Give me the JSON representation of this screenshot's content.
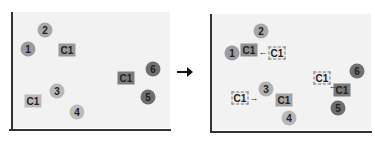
{
  "colors": {
    "background": "#f2f2f2",
    "axis": "#333333",
    "solid_box": "#8a8a8a",
    "node_light": "#b5b5b5",
    "node_mid": "#9a9a9a",
    "node_dark": "#6e6e6e"
  },
  "left": {
    "nodes": [
      {
        "label": "2",
        "x": 45,
        "y": 30,
        "shade": "#a8a8a8"
      },
      {
        "label": "1",
        "x": 28,
        "y": 49,
        "shade": "#9c9c9c"
      },
      {
        "label": "6",
        "x": 153,
        "y": 69,
        "shade": "#707070"
      },
      {
        "label": "5",
        "x": 148,
        "y": 97,
        "shade": "#6e6e6e"
      },
      {
        "label": "3",
        "x": 57,
        "y": 91,
        "shade": "#b8b8b8"
      },
      {
        "label": "4",
        "x": 77,
        "y": 112,
        "shade": "#bdbdbd"
      }
    ],
    "boxes": [
      {
        "label": "C1",
        "x": 67,
        "y": 50,
        "shade": "#9a9a9a"
      },
      {
        "label": "C1",
        "x": 126,
        "y": 78,
        "shade": "#7c7c7c"
      },
      {
        "label": "C1",
        "x": 33,
        "y": 101,
        "shade": "#bcbcbc"
      }
    ]
  },
  "transition_arrow": "→",
  "right": {
    "nodes": [
      {
        "label": "2",
        "x": 261,
        "y": 31,
        "shade": "#a8a8a8"
      },
      {
        "label": "1",
        "x": 232,
        "y": 53,
        "shade": "#9c9c9c"
      },
      {
        "label": "6",
        "x": 357,
        "y": 71,
        "shade": "#707070"
      },
      {
        "label": "5",
        "x": 338,
        "y": 108,
        "shade": "#6e6e6e"
      },
      {
        "label": "3",
        "x": 266,
        "y": 89,
        "shade": "#b0b0b0"
      },
      {
        "label": "4",
        "x": 289,
        "y": 118,
        "shade": "#b8b8b8"
      }
    ],
    "boxes": [
      {
        "label": "C1",
        "x": 249,
        "y": 50,
        "style": "solid",
        "shade": "#8f8f8f"
      },
      {
        "label": "C1",
        "x": 277,
        "y": 53,
        "style": "dashed"
      },
      {
        "label": "C1",
        "x": 322,
        "y": 78,
        "style": "dashed"
      },
      {
        "label": "C1",
        "x": 342,
        "y": 90,
        "style": "solid",
        "shade": "#7a7a7a"
      },
      {
        "label": "C1",
        "x": 240,
        "y": 98,
        "style": "dashed"
      },
      {
        "label": "C1",
        "x": 284,
        "y": 100,
        "style": "solid",
        "shade": "#a5a5a5"
      }
    ],
    "arrows": [
      {
        "glyph": "←",
        "x": 263,
        "y": 52
      },
      {
        "glyph": "←",
        "x": 333,
        "y": 86
      },
      {
        "glyph": "→",
        "x": 254,
        "y": 98
      }
    ]
  }
}
